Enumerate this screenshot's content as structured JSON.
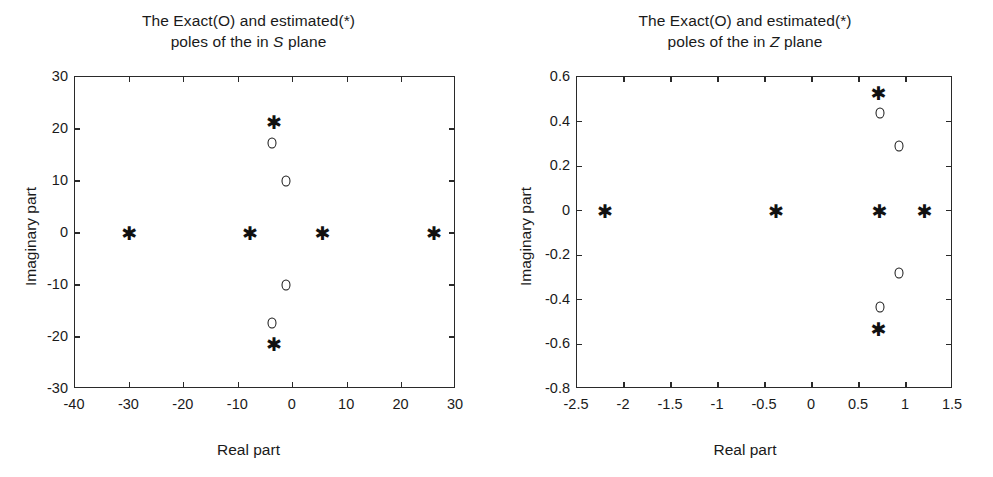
{
  "figure": {
    "panels": [
      {
        "id": "s-plane",
        "title_line1": "The Exact(O) and estimated(*)",
        "title_line2_pre": "poles of the in ",
        "title_line2_italic": "S",
        "title_line2_post": " plane",
        "xlabel": "Real part",
        "ylabel": "Imaginary part",
        "xticks": [
          "-40",
          "-30",
          "-20",
          "-10",
          "0",
          "10",
          "20",
          "30"
        ],
        "yticks": [
          "30",
          "20",
          "10",
          "0",
          "-10",
          "-20",
          "-30"
        ]
      },
      {
        "id": "z-plane",
        "title_line1": "The Exact(O) and estimated(*)",
        "title_line2_pre": "poles of the in ",
        "title_line2_italic": "Z",
        "title_line2_post": " plane",
        "xlabel": "Real part",
        "ylabel": "Imaginary part",
        "xticks": [
          "-2.5",
          "-2",
          "-1.5",
          "-1",
          "-0.5",
          "0",
          "0.5",
          "1",
          "1.5"
        ],
        "yticks": [
          "0.6",
          "0.4",
          "0.2",
          "0",
          "-0.2",
          "-0.4",
          "-0.6",
          "-0.8"
        ]
      }
    ]
  },
  "chart_data": [
    {
      "type": "scatter",
      "title": "The Exact(O) and estimated(*) poles of the in S plane",
      "xlabel": "Real part",
      "ylabel": "Imaginary part",
      "xlim": [
        -40,
        30
      ],
      "ylim": [
        -30,
        30
      ],
      "xticks": [
        -40,
        -30,
        -20,
        -10,
        0,
        10,
        20,
        30
      ],
      "yticks": [
        -30,
        -20,
        -10,
        0,
        10,
        20,
        30
      ],
      "grid": false,
      "legend": "in-title",
      "series": [
        {
          "name": "Exact poles (O)",
          "marker": "circle",
          "points": [
            [
              -3.8,
              17.4
            ],
            [
              -1.2,
              10.0
            ],
            [
              -1.2,
              -10.0
            ],
            [
              -3.8,
              -17.4
            ]
          ]
        },
        {
          "name": "Estimated poles (*)",
          "marker": "asterisk",
          "points": [
            [
              -3.4,
              21.3
            ],
            [
              -30.0,
              0.0
            ],
            [
              -7.8,
              0.0
            ],
            [
              5.5,
              0.0
            ],
            [
              26.0,
              0.0
            ],
            [
              -3.4,
              -21.3
            ]
          ]
        }
      ]
    },
    {
      "type": "scatter",
      "title": "The Exact(O) and estimated(*) poles of the in Z plane",
      "xlabel": "Real part",
      "ylabel": "Imaginary part",
      "xlim": [
        -2.5,
        1.5
      ],
      "ylim": [
        -0.8,
        0.6
      ],
      "xticks": [
        -2.5,
        -2,
        -1.5,
        -1,
        -0.5,
        0,
        0.5,
        1,
        1.5
      ],
      "yticks": [
        -0.8,
        -0.6,
        -0.4,
        -0.2,
        0,
        0.2,
        0.4,
        0.6
      ],
      "grid": false,
      "legend": "in-title",
      "series": [
        {
          "name": "Exact poles (O)",
          "marker": "circle",
          "points": [
            [
              0.72,
              0.44
            ],
            [
              0.93,
              0.29
            ],
            [
              0.93,
              -0.28
            ],
            [
              0.72,
              -0.43
            ]
          ]
        },
        {
          "name": "Estimated poles (*)",
          "marker": "asterisk",
          "points": [
            [
              0.71,
              0.53
            ],
            [
              -2.2,
              0.0
            ],
            [
              -0.38,
              0.0
            ],
            [
              0.72,
              0.0
            ],
            [
              1.2,
              0.0
            ],
            [
              0.71,
              -0.53
            ]
          ]
        }
      ]
    }
  ]
}
